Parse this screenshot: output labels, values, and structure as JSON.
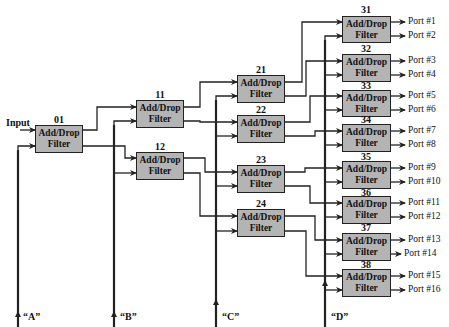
{
  "diagram": {
    "input_label": "Input",
    "filter_line1": "Add/Drop",
    "filter_line2": "Filter",
    "colors": {
      "box_fill": "#b4b4b4",
      "line": "#222222"
    },
    "buses": [
      {
        "id": "A",
        "label": "“A”",
        "x": 18
      },
      {
        "id": "B",
        "label": "“B”",
        "x": 114
      },
      {
        "id": "C",
        "label": "“C”",
        "x": 216
      },
      {
        "id": "D",
        "label": "“D”",
        "x": 325
      }
    ],
    "stages": [
      {
        "stage": 0,
        "filters": [
          {
            "id": "01"
          }
        ]
      },
      {
        "stage": 1,
        "filters": [
          {
            "id": "11"
          },
          {
            "id": "12"
          }
        ]
      },
      {
        "stage": 2,
        "filters": [
          {
            "id": "21"
          },
          {
            "id": "22"
          },
          {
            "id": "23"
          },
          {
            "id": "24"
          }
        ]
      },
      {
        "stage": 3,
        "filters": [
          {
            "id": "31"
          },
          {
            "id": "32"
          },
          {
            "id": "33"
          },
          {
            "id": "34"
          },
          {
            "id": "35"
          },
          {
            "id": "36"
          },
          {
            "id": "37"
          },
          {
            "id": "38"
          }
        ]
      }
    ],
    "ports": [
      "Port #1",
      "Port #2",
      "Port #3",
      "Port #4",
      "Port #5",
      "Port #6",
      "Port #7",
      "Port #8",
      "Port #9",
      "Port #10",
      "Port #11",
      "Port #12",
      "Port #13",
      "Port #14",
      "Port #15",
      "Port #16"
    ]
  }
}
